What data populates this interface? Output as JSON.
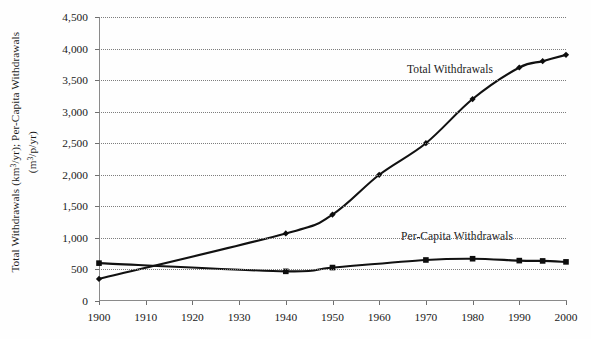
{
  "chart_data": {
    "type": "line",
    "title": "",
    "subtitle": "",
    "xlabel": "",
    "ylabel_line1": "Total Withdrawals (km3/yr); Per-Capita Withdrawals",
    "ylabel_line2": "(m3/p/yr)",
    "xlim": [
      1900,
      2000
    ],
    "ylim": [
      0,
      4500
    ],
    "grid": "horizontal-dotted",
    "legend_position": "inline-annotations",
    "y_ticks": [
      "0",
      "500",
      "1,000",
      "1,500",
      "2,000",
      "2,500",
      "3,000",
      "3,500",
      "4,000",
      "4,500"
    ],
    "y_tick_values": [
      0,
      500,
      1000,
      1500,
      2000,
      2500,
      3000,
      3500,
      4000,
      4500
    ],
    "x_ticks": [
      "1900",
      "1910",
      "1920",
      "1930",
      "1940",
      "1950",
      "1960",
      "1970",
      "1980",
      "1990",
      "2000"
    ],
    "x_tick_values": [
      1900,
      1910,
      1920,
      1930,
      1940,
      1950,
      1960,
      1970,
      1980,
      1990,
      2000
    ],
    "annotations": [
      {
        "text": "Total Withdrawals",
        "x": 1975,
        "y": 3950
      },
      {
        "text": "Per-Capita Withdrawals",
        "x": 1972,
        "y": 1150
      }
    ],
    "series": [
      {
        "name": "Total Withdrawals",
        "unit": "km3/yr",
        "marker": "diamond",
        "x": [
          1900,
          1940,
          1950,
          1960,
          1970,
          1980,
          1990,
          1995,
          2000
        ],
        "values": [
          350,
          1070,
          1370,
          2000,
          2500,
          3200,
          3700,
          3800,
          3900
        ]
      },
      {
        "name": "Per-Capita Withdrawals",
        "unit": "m3/p/yr",
        "marker": "square",
        "x": [
          1900,
          1940,
          1950,
          1970,
          1980,
          1990,
          1995,
          2000
        ],
        "values": [
          600,
          470,
          530,
          650,
          670,
          640,
          635,
          620
        ]
      }
    ]
  }
}
